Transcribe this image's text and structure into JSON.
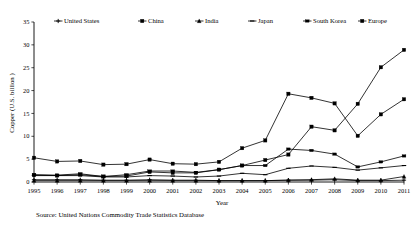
{
  "figure": {
    "source_note": "Source: United Nations Commodity Trade Statistics Database"
  },
  "chart_data": {
    "type": "line",
    "title": "",
    "xlabel": "Year",
    "ylabel": "Copper (U.S. billion )",
    "xlim": [
      1995,
      2011
    ],
    "ylim": [
      0,
      35
    ],
    "ytick_labels": [
      "0",
      "5",
      "10",
      "15",
      "20",
      "25",
      "30",
      "35"
    ],
    "yticks": [
      0,
      5,
      10,
      15,
      20,
      25,
      30,
      35
    ],
    "grid": false,
    "legend_position": "top",
    "categories": [
      1995,
      1996,
      1997,
      1998,
      1999,
      2000,
      2001,
      2002,
      2003,
      2004,
      2005,
      2006,
      2007,
      2008,
      2009,
      2010,
      2011
    ],
    "xtick_labels": [
      "1995",
      "1996",
      "1997",
      "1998",
      "1999",
      "2000",
      "2001",
      "2002",
      "2003",
      "2004",
      "2005",
      "2006",
      "2007",
      "2008",
      "2009",
      "2010",
      "2011"
    ],
    "series": [
      {
        "name": "United States",
        "marker": "cross",
        "values": [
          0.5,
          0.5,
          0.5,
          0.4,
          0.4,
          0.5,
          0.4,
          0.4,
          0.3,
          0.3,
          0.3,
          0.4,
          0.4,
          0.5,
          0.3,
          0.3,
          0.4
        ]
      },
      {
        "name": "China",
        "marker": "square",
        "values": [
          1.5,
          1.4,
          1.6,
          1.2,
          1.3,
          2.2,
          2.0,
          2.0,
          2.7,
          3.6,
          4.8,
          6.0,
          12.1,
          11.3,
          17.1,
          25.1,
          28.9
        ]
      },
      {
        "name": "India",
        "marker": "triangle",
        "values": [
          0.3,
          0.3,
          0.3,
          0.3,
          0.3,
          0.3,
          0.3,
          0.3,
          0.3,
          0.3,
          0.3,
          0.4,
          0.5,
          0.7,
          0.4,
          0.4,
          1.2
        ]
      },
      {
        "name": "Japan",
        "marker": "line",
        "values": [
          1.4,
          1.4,
          1.4,
          1.1,
          1.1,
          1.4,
          1.3,
          1.1,
          1.3,
          1.9,
          1.6,
          3.0,
          3.5,
          3.2,
          2.6,
          3.1,
          3.6
        ]
      },
      {
        "name": "South Korea",
        "marker": "dash",
        "values": [
          1.6,
          1.5,
          1.8,
          1.2,
          1.6,
          2.4,
          2.4,
          2.1,
          2.7,
          3.6,
          3.6,
          7.2,
          6.9,
          6.1,
          3.3,
          4.4,
          5.7
        ]
      },
      {
        "name": "Europe",
        "marker": "square",
        "values": [
          5.3,
          4.5,
          4.6,
          3.8,
          3.9,
          4.9,
          4.0,
          3.9,
          4.4,
          7.4,
          9.1,
          19.3,
          18.4,
          17.2,
          10.1,
          14.8,
          18.1
        ]
      }
    ]
  }
}
